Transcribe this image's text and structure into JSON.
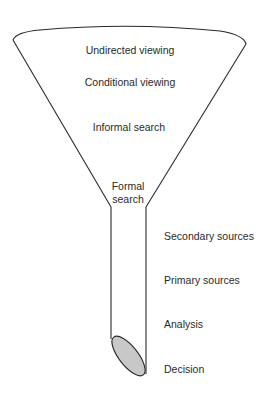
{
  "diagram": {
    "type": "funnel",
    "funnel_stages": [
      {
        "label": "Undirected viewing"
      },
      {
        "label": "Conditional viewing"
      },
      {
        "label": "Informal search"
      },
      {
        "label": "Formal search"
      }
    ],
    "formal_search_lines": [
      "Formal",
      "search"
    ],
    "tube_stages": [
      {
        "label": "Secondary sources"
      },
      {
        "label": "Primary sources"
      },
      {
        "label": "Analysis"
      },
      {
        "label": "Decision"
      }
    ],
    "colors": {
      "stroke": "#2a2a2a",
      "outlet_fill": "#c8c8c8",
      "background": "#ffffff"
    }
  }
}
